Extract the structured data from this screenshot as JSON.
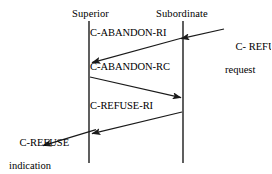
{
  "diagram": {
    "type": "sequence-diagram",
    "title": "",
    "line_color": "#1a1a1a",
    "background": "#ffffff",
    "lifelines": [
      {
        "id": "superior",
        "label": "Superior",
        "x": 89,
        "top": 21,
        "bottom": 163
      },
      {
        "id": "subordinate",
        "label": "Subordinate",
        "x": 183,
        "top": 21,
        "bottom": 163
      }
    ],
    "messages": [
      {
        "id": "c-abandon-ri",
        "label": "C-ABANDON-RI",
        "from": "subordinate",
        "to": "superior",
        "direction": "right-to-left",
        "x1": 182,
        "y1": 38,
        "x2": 91,
        "y2": 63,
        "label_x": 88,
        "label_y": 27
      },
      {
        "id": "c-abandon-rc",
        "label": "C-ABANDON-RC",
        "from": "superior",
        "to": "subordinate",
        "direction": "left-to-right",
        "x1": 90,
        "y1": 77,
        "x2": 182,
        "y2": 98,
        "label_x": 88,
        "label_y": 61
      },
      {
        "id": "c-refuse-ri",
        "label": "C-REFUSE-RI",
        "from": "subordinate",
        "to": "superior",
        "direction": "right-to-left",
        "x1": 182,
        "y1": 112,
        "x2": 91,
        "y2": 134,
        "label_x": 88,
        "label_y": 100
      }
    ],
    "external_arrows": [
      {
        "id": "c-refuse-request-arrow",
        "direction": "right-to-left",
        "x1": 224,
        "y1": 29,
        "x2": 180,
        "y2": 39
      },
      {
        "id": "c-refuse-indication-arrow",
        "direction": "right-to-left",
        "x1": 95,
        "y1": 130,
        "x2": 42,
        "y2": 146
      }
    ],
    "annotations": [
      {
        "id": "c-refuse-request",
        "line1": "C- REFUSE",
        "line2": "request",
        "x": 225,
        "y": 30,
        "align": "left"
      },
      {
        "id": "c-refuse-indication",
        "line1": "C-REFUSE",
        "line2": "indication",
        "x": 9,
        "y": 126,
        "align": "left"
      }
    ]
  }
}
